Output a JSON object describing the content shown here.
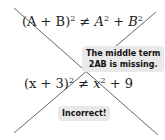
{
  "equations": {
    "eq1": {
      "lhs": "(A + B)",
      "lhs_exp": "2",
      "op": "≠",
      "t1": "A",
      "t1_exp": "2",
      "plus": "+",
      "t2": "B",
      "t2_exp": "2"
    },
    "eq2": {
      "lhs": "(x + 3)",
      "lhs_exp": "2",
      "op": "≠",
      "t1": "x",
      "t1_exp": "2",
      "plus": "+",
      "t2": "9"
    }
  },
  "callouts": {
    "c1": {
      "line1": "The middle term",
      "line2": "2AB is missing."
    },
    "c2": {
      "text": "Incorrect!"
    }
  },
  "colors": {
    "line": "#555555",
    "callout_bg": "#e9e9e9"
  }
}
